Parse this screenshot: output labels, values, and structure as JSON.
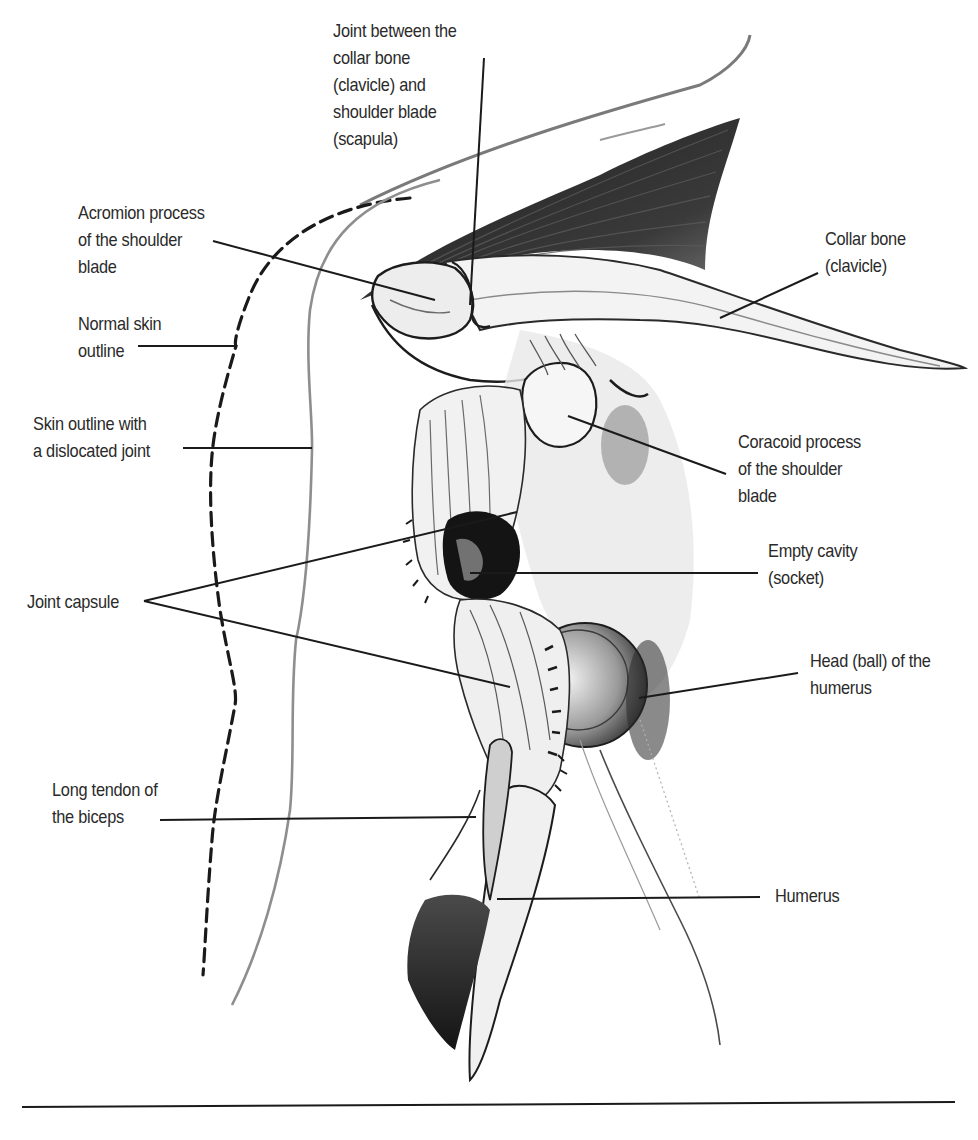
{
  "figure": {
    "colors": {
      "background": "#ffffff",
      "label_text": "#2a2a2a",
      "leader_line": "#1a1a1a",
      "ink_dark": "#1c1c1c",
      "ink_mid": "#6e6e6e",
      "ink_light": "#b5b5b5"
    },
    "labels": [
      {
        "id": "joint-clavicle-scapula",
        "lines": [
          "Joint between the",
          "collar bone",
          "(clavicle) and",
          "shoulder blade",
          "(scapula)"
        ],
        "x": 333,
        "y": 17,
        "leaders": [
          [
            484,
            58,
            470,
            305
          ]
        ]
      },
      {
        "id": "acromion-process",
        "lines": [
          "Acromion process",
          "of the shoulder",
          "blade"
        ],
        "x": 78,
        "y": 60,
        "leaders": [
          [
            213,
            241,
            435,
            300
          ]
        ]
      },
      {
        "id": "collar-bone",
        "lines": [
          "Collar bone",
          "(clavicle)"
        ],
        "x": 825,
        "y": 225,
        "leaders": [
          [
            818,
            273,
            720,
            318
          ]
        ]
      },
      {
        "id": "normal-skin-outline",
        "lines": [
          "Normal skin",
          "outline"
        ],
        "x": 78,
        "y": 286,
        "leaders": [
          [
            138,
            346,
            235,
            346
          ]
        ]
      },
      {
        "id": "skin-outline-dislocated",
        "lines": [
          "Skin outline with",
          "a dislocated joint"
        ],
        "x": 33,
        "y": 415,
        "leaders": [
          [
            183,
            448,
            312,
            448
          ]
        ]
      },
      {
        "id": "coracoid-process",
        "lines": [
          "Coracoid process",
          "of the shoulder",
          "blade"
        ],
        "x": 738,
        "y": 428,
        "leaders": [
          [
            726,
            474,
            568,
            416
          ]
        ]
      },
      {
        "id": "empty-cavity",
        "lines": [
          "Empty cavity",
          "(socket)"
        ],
        "x": 768,
        "y": 537,
        "leaders": [
          [
            758,
            573,
            470,
            573
          ]
        ]
      },
      {
        "id": "joint-capsule",
        "lines": [
          "Joint capsule"
        ],
        "x": 27,
        "y": 588,
        "leaders": [
          [
            144,
            601,
            517,
            512
          ],
          [
            144,
            601,
            510,
            687
          ]
        ]
      },
      {
        "id": "head-of-humerus",
        "lines": [
          "Head (ball) of the",
          "humerus"
        ],
        "x": 810,
        "y": 647,
        "leaders": [
          [
            798,
            673,
            639,
            698
          ]
        ]
      },
      {
        "id": "long-tendon-biceps",
        "lines": [
          "Long tendon of",
          "the biceps"
        ],
        "x": 52,
        "y": 776,
        "leaders": [
          [
            160,
            820,
            476,
            817
          ]
        ]
      },
      {
        "id": "humerus",
        "lines": [
          "Humerus"
        ],
        "x": 775,
        "y": 880,
        "leaders": [
          [
            760,
            897,
            497,
            899
          ]
        ]
      }
    ],
    "footer_rule": {
      "x1": 22,
      "y1": 1107,
      "x2": 955,
      "y2": 1102
    }
  }
}
